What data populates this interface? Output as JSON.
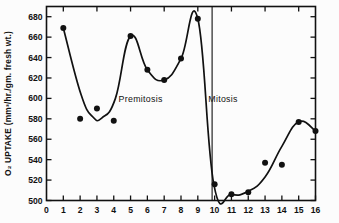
{
  "chart_data": {
    "type": "line",
    "title": "",
    "xlabel": "",
    "ylabel": "O₂ UPTAKE  (mm³/hr./gm. fresh wt.)",
    "xlim": [
      0,
      16
    ],
    "ylim": [
      500,
      680
    ],
    "grid": false,
    "legend": null,
    "x_ticks": [
      "0",
      "1",
      "2",
      "3",
      "4",
      "5",
      "6",
      "7",
      "8",
      "9",
      "10",
      "11",
      "12",
      "13",
      "14",
      "15",
      "16"
    ],
    "x_tick_values": [
      0,
      1,
      2,
      3,
      4,
      5,
      6,
      7,
      8,
      9,
      10,
      11,
      12,
      13,
      14,
      15,
      16
    ],
    "y_ticks": [
      "500",
      "520",
      "540",
      "560",
      "580",
      "600",
      "620",
      "640",
      "660",
      "680"
    ],
    "y_tick_values": [
      500,
      520,
      540,
      560,
      580,
      600,
      620,
      640,
      660,
      680
    ],
    "series": [
      {
        "name": "O2 uptake",
        "marker": "filled-circle",
        "x": [
          1,
          2,
          3,
          4,
          5,
          6,
          7,
          8,
          9,
          10,
          11,
          12,
          13,
          14,
          15,
          16
        ],
        "values": [
          669,
          580,
          590,
          578,
          661,
          628,
          618,
          639,
          678,
          516,
          506,
          508,
          537,
          535,
          577,
          568
        ]
      }
    ],
    "curve_points": [
      {
        "x": 1,
        "y": 669
      },
      {
        "x": 2.05,
        "y": 604
      },
      {
        "x": 2.75,
        "y": 582
      },
      {
        "x": 3.3,
        "y": 581
      },
      {
        "x": 4.1,
        "y": 600
      },
      {
        "x": 5,
        "y": 661
      },
      {
        "x": 6,
        "y": 628
      },
      {
        "x": 7,
        "y": 618
      },
      {
        "x": 8,
        "y": 639
      },
      {
        "x": 9,
        "y": 678
      },
      {
        "x": 9.95,
        "y": 516
      },
      {
        "x": 11,
        "y": 506
      },
      {
        "x": 12,
        "y": 509
      },
      {
        "x": 13,
        "y": 523
      },
      {
        "x": 14,
        "y": 553
      },
      {
        "x": 15,
        "y": 577
      },
      {
        "x": 16,
        "y": 568
      }
    ],
    "annotations": [
      {
        "id": "premitosis",
        "text": "Premitosis",
        "x": 5.6,
        "y": 596
      },
      {
        "id": "mitosis",
        "text": "Mitosis",
        "x": 10.5,
        "y": 596
      }
    ],
    "vline": {
      "x": 9.85,
      "y_top": 690,
      "y_bottom": 500
    },
    "axis_style": {
      "frame": "box",
      "ticks_inward": true,
      "tick_sides": [
        "left",
        "right",
        "top",
        "bottom"
      ],
      "color": "#111111"
    }
  },
  "colors": {
    "ink": "#111111",
    "background": "#fcfcfc"
  }
}
